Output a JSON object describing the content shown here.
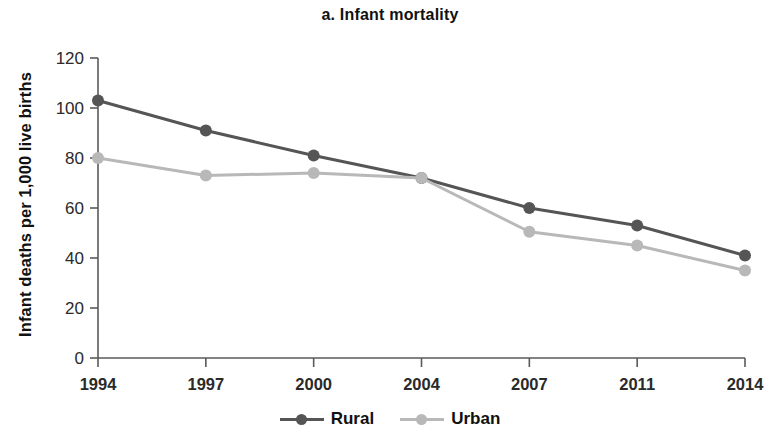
{
  "chart_data": {
    "type": "line",
    "title": "a. Infant mortality",
    "xlabel": "",
    "ylabel": "Infant deaths per 1,000 live births",
    "categories": [
      "1994",
      "1997",
      "2000",
      "2004",
      "2007",
      "2011",
      "2014"
    ],
    "yticks": [
      "0",
      "20",
      "40",
      "60",
      "80",
      "100",
      "120"
    ],
    "ylim": [
      0,
      120
    ],
    "grid": false,
    "legend_position": "bottom-center",
    "series": [
      {
        "name": "Rural",
        "color": "#555555",
        "values": [
          103,
          91,
          81,
          72,
          60,
          53,
          41
        ]
      },
      {
        "name": "Urban",
        "color": "#b8b8b8",
        "values": [
          80,
          73,
          74,
          72,
          50.5,
          45,
          35
        ]
      }
    ]
  }
}
